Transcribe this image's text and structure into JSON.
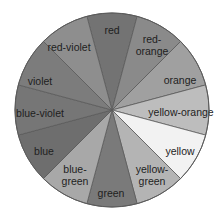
{
  "diagram": {
    "type": "color-wheel",
    "center": [
      112,
      110
    ],
    "radius": 97,
    "outline_color": "#5a5a5a",
    "segments": [
      {
        "label": [
          "red"
        ],
        "fill": "#737373",
        "text_pos": [
          112,
          30
        ]
      },
      {
        "label": [
          "red-",
          "orange"
        ],
        "fill": "#8a8a8a",
        "text_pos": [
          152,
          45
        ]
      },
      {
        "label": [
          "orange"
        ],
        "fill": "#a0a0a0",
        "text_pos": [
          180,
          80
        ]
      },
      {
        "label": [
          "yellow-orange"
        ],
        "fill": "#bdbdbd",
        "text_pos": [
          181,
          112
        ]
      },
      {
        "label": [
          "yellow"
        ],
        "fill": "#f2f2f2",
        "text_pos": [
          180,
          151
        ]
      },
      {
        "label": [
          "yellow-",
          "green"
        ],
        "fill": "#b4b4b4",
        "text_pos": [
          152,
          175
        ]
      },
      {
        "label": [
          "green"
        ],
        "fill": "#7a7a7a",
        "text_pos": [
          111,
          193
        ]
      },
      {
        "label": [
          "blue-",
          "green"
        ],
        "fill": "#a8a8a8",
        "text_pos": [
          75,
          175
        ]
      },
      {
        "label": [
          "blue"
        ],
        "fill": "#6e6e6e",
        "text_pos": [
          44,
          151
        ]
      },
      {
        "label": [
          "blue-violet"
        ],
        "fill": "#767676",
        "text_pos": [
          40,
          113
        ]
      },
      {
        "label": [
          "violet"
        ],
        "fill": "#7c7c7c",
        "text_pos": [
          40,
          81
        ]
      },
      {
        "label": [
          "red-violet"
        ],
        "fill": "#8e8e8e",
        "text_pos": [
          69,
          47
        ]
      }
    ]
  }
}
